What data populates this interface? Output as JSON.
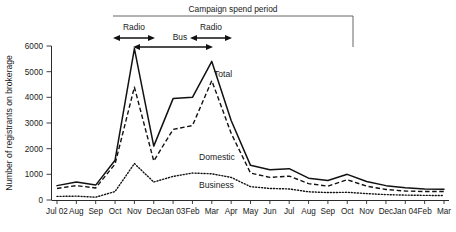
{
  "chart_data": {
    "type": "line",
    "title": "",
    "xlabel": "",
    "ylabel": "Number of registrants on brokerage",
    "ylim": [
      0,
      6000
    ],
    "yticks": [
      0,
      1000,
      2000,
      3000,
      4000,
      5000,
      6000
    ],
    "ytick_labels": [
      "0",
      "1000",
      "2000",
      "3000",
      "4000",
      "5000",
      "6000"
    ],
    "grid": false,
    "legend_position": "inline-labels",
    "categories": [
      "Jul 02",
      "Aug",
      "Sep",
      "Oct",
      "Nov",
      "Dec",
      "Jan 03",
      "Feb",
      "Mar",
      "Apr",
      "May",
      "Jun",
      "Jul",
      "Aug",
      "Sep",
      "Oct",
      "Nov",
      "Dec",
      "Jan 04",
      "Feb",
      "Mar"
    ],
    "series": [
      {
        "name": "Total",
        "style": "solid",
        "values": [
          560,
          700,
          580,
          1550,
          5900,
          2100,
          3950,
          4000,
          5400,
          3100,
          1350,
          1180,
          1220,
          850,
          760,
          1000,
          720,
          560,
          480,
          430,
          420
        ]
      },
      {
        "name": "Domestic",
        "style": "dashed",
        "values": [
          450,
          560,
          470,
          1400,
          4400,
          1520,
          2750,
          2900,
          4650,
          2600,
          1050,
          880,
          930,
          640,
          540,
          790,
          540,
          410,
          350,
          330,
          330
        ]
      },
      {
        "name": "Business",
        "style": "dotted",
        "values": [
          140,
          150,
          110,
          330,
          1420,
          700,
          920,
          1050,
          1020,
          880,
          520,
          450,
          430,
          320,
          290,
          300,
          250,
          210,
          190,
          180,
          175
        ]
      }
    ],
    "annotations": {
      "campaign_title": "Campaign spend period",
      "bracket_label": "Campaign spend period",
      "spans": [
        {
          "label": "Radio",
          "from": "Oct",
          "to": "Nov"
        },
        {
          "label": "Bus",
          "from": "Nov",
          "to": "Mar"
        },
        {
          "label": "Radio",
          "from": "Feb",
          "to": "Mar"
        }
      ],
      "series_labels": [
        {
          "text": "Total"
        },
        {
          "text": "Domestic"
        },
        {
          "text": "Business"
        }
      ]
    }
  }
}
